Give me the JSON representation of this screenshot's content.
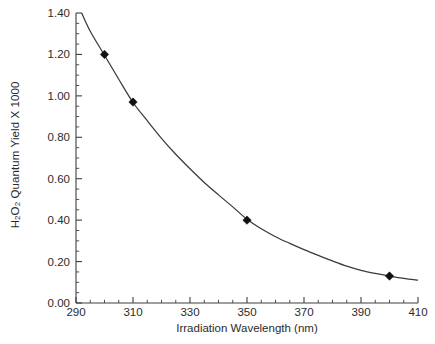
{
  "chart_data": {
    "type": "line",
    "title": "",
    "xlabel": "Irradiation Wavelength (nm)",
    "ylabel_html": "H<sub>2</sub>O<sub>2</sub> Quantum Yield X 1000",
    "ylabel_text": "H2O2 Quantum Yield X 1000",
    "xlim": [
      290,
      410
    ],
    "ylim": [
      0.0,
      1.4
    ],
    "xticks": [
      290,
      310,
      330,
      350,
      370,
      390,
      410
    ],
    "xtick_labels": [
      "290",
      "310",
      "330",
      "350",
      "370",
      "390",
      "410"
    ],
    "yticks": [
      0.0,
      0.2,
      0.4,
      0.6,
      0.8,
      1.0,
      1.2,
      1.4
    ],
    "ytick_labels": [
      "0.00",
      "0.20",
      "0.40",
      "0.60",
      "0.80",
      "1.00",
      "1.20",
      "1.40"
    ],
    "x_minor_step": 5,
    "y_minor_step": 0.05,
    "grid": false,
    "legend": null,
    "series": [
      {
        "name": "H2O2 Quantum Yield",
        "marker": "diamond",
        "marker_color": "#111111",
        "line_color": "#3a3a3a",
        "points": [
          {
            "x": 300,
            "y": 1.2
          },
          {
            "x": 310,
            "y": 0.97
          },
          {
            "x": 350,
            "y": 0.4
          },
          {
            "x": 400,
            "y": 0.13
          }
        ],
        "fit_curve": [
          {
            "x": 292.0,
            "y": 1.4
          },
          {
            "x": 295.0,
            "y": 1.312
          },
          {
            "x": 300.0,
            "y": 1.196
          },
          {
            "x": 305.0,
            "y": 1.08
          },
          {
            "x": 310.0,
            "y": 0.968
          },
          {
            "x": 315.0,
            "y": 0.88
          },
          {
            "x": 320.0,
            "y": 0.795
          },
          {
            "x": 325.0,
            "y": 0.718
          },
          {
            "x": 330.0,
            "y": 0.648
          },
          {
            "x": 335.0,
            "y": 0.582
          },
          {
            "x": 340.0,
            "y": 0.522
          },
          {
            "x": 345.0,
            "y": 0.464
          },
          {
            "x": 350.0,
            "y": 0.404
          },
          {
            "x": 355.0,
            "y": 0.358
          },
          {
            "x": 360.0,
            "y": 0.32
          },
          {
            "x": 365.0,
            "y": 0.288
          },
          {
            "x": 370.0,
            "y": 0.258
          },
          {
            "x": 375.0,
            "y": 0.23
          },
          {
            "x": 380.0,
            "y": 0.203
          },
          {
            "x": 385.0,
            "y": 0.178
          },
          {
            "x": 390.0,
            "y": 0.158
          },
          {
            "x": 395.0,
            "y": 0.143
          },
          {
            "x": 400.0,
            "y": 0.13
          },
          {
            "x": 405.0,
            "y": 0.119
          },
          {
            "x": 410.0,
            "y": 0.11
          }
        ]
      }
    ]
  },
  "colors": {
    "axis": "#3f3f3f",
    "curve": "#3a3a3a",
    "marker": "#111111",
    "text": "#2b2b2b",
    "background": "#ffffff"
  }
}
